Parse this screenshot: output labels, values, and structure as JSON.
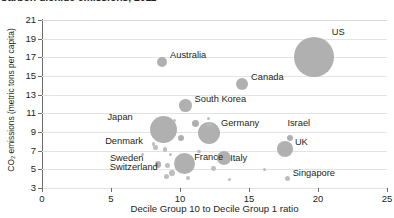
{
  "chart_data": {
    "type": "scatter",
    "title": "Carbon dioxide emissions, 2011",
    "xlabel": "Decile Group 10 to Decile Group 1 ratio",
    "ylabel": "CO₂ emissions (metric tons per capita)",
    "xlim": [
      0,
      25
    ],
    "ylim": [
      3,
      21
    ],
    "xticks": [
      "0",
      "5",
      "10",
      "15",
      "20",
      "25"
    ],
    "yticks": [
      "3",
      "5",
      "7",
      "9",
      "11",
      "13",
      "15",
      "17",
      "19",
      "21"
    ],
    "grid": "horizontal",
    "legend": "none",
    "size_meaning": "bubble area scales with population",
    "points": [
      {
        "name": "US",
        "x": 19.7,
        "y": 17.0,
        "r": 20.0,
        "labeled": true,
        "label_dx": 18,
        "label_dy": -24
      },
      {
        "name": "Australia",
        "x": 8.7,
        "y": 16.5,
        "r": 5.2,
        "labeled": true,
        "label_dx": 8,
        "label_dy": -6
      },
      {
        "name": "Canada",
        "x": 14.5,
        "y": 14.1,
        "r": 6.0,
        "labeled": true,
        "label_dx": 9,
        "label_dy": -6
      },
      {
        "name": "South Korea",
        "x": 10.4,
        "y": 11.8,
        "r": 6.4,
        "labeled": true,
        "label_dx": 9,
        "label_dy": -6
      },
      {
        "name": "Japan",
        "x": 8.8,
        "y": 9.3,
        "r": 13.5,
        "labeled": true,
        "label_dx": -56,
        "label_dy": -11
      },
      {
        "name": "Germany",
        "x": 12.1,
        "y": 8.9,
        "r": 11.0,
        "labeled": true,
        "label_dx": 12,
        "label_dy": -9
      },
      {
        "name": "Israel",
        "x": 18.0,
        "y": 8.4,
        "r": 3.0,
        "labeled": true,
        "label_dx": -3,
        "label_dy": -14
      },
      {
        "name": "UK",
        "x": 17.6,
        "y": 7.2,
        "r": 8.2,
        "labeled": true,
        "label_dx": 10,
        "label_dy": -6
      },
      {
        "name": "Denmark",
        "x": 8.2,
        "y": 7.3,
        "r": 2.6,
        "labeled": true,
        "label_dx": -50,
        "label_dy": -6
      },
      {
        "name": "France",
        "x": 10.3,
        "y": 5.6,
        "r": 10.5,
        "labeled": true,
        "label_dx": 10,
        "label_dy": -6
      },
      {
        "name": "Sweden",
        "x": 8.4,
        "y": 5.5,
        "r": 3.2,
        "labeled": true,
        "label_dx": -48,
        "label_dy": -6
      },
      {
        "name": "Switzerland",
        "x": 9.4,
        "y": 4.6,
        "r": 2.8,
        "labeled": true,
        "label_dx": -62,
        "label_dy": -5
      },
      {
        "name": "Italy",
        "x": 13.2,
        "y": 6.2,
        "r": 7.2,
        "labeled": true,
        "label_dx": 6,
        "label_dy": 1
      },
      {
        "name": "Singapore",
        "x": 17.8,
        "y": 4.0,
        "r": 2.6,
        "labeled": true,
        "label_dx": 5,
        "label_dy": -5
      },
      {
        "name": "unlabeled-1",
        "x": 11.1,
        "y": 9.9,
        "r": 3.4,
        "labeled": false
      },
      {
        "name": "unlabeled-2",
        "x": 12.1,
        "y": 9.8,
        "r": 2.6,
        "labeled": false
      },
      {
        "name": "unlabeled-3",
        "x": 10.1,
        "y": 8.4,
        "r": 3.0,
        "labeled": false
      },
      {
        "name": "unlabeled-4",
        "x": 8.1,
        "y": 7.7,
        "r": 1.7,
        "labeled": false
      },
      {
        "name": "unlabeled-5",
        "x": 8.9,
        "y": 7.1,
        "r": 2.3,
        "labeled": false
      },
      {
        "name": "unlabeled-6",
        "x": 11.4,
        "y": 6.9,
        "r": 1.9,
        "labeled": false
      },
      {
        "name": "unlabeled-7",
        "x": 9.3,
        "y": 6.6,
        "r": 1.5,
        "labeled": false
      },
      {
        "name": "unlabeled-8",
        "x": 7.3,
        "y": 6.6,
        "r": 1.5,
        "labeled": false
      },
      {
        "name": "unlabeled-9",
        "x": 9.1,
        "y": 5.4,
        "r": 2.6,
        "labeled": false
      },
      {
        "name": "unlabeled-10",
        "x": 12.4,
        "y": 5.1,
        "r": 2.4,
        "labeled": false
      },
      {
        "name": "unlabeled-11",
        "x": 9.0,
        "y": 4.2,
        "r": 2.6,
        "labeled": false
      },
      {
        "name": "unlabeled-12",
        "x": 10.6,
        "y": 4.1,
        "r": 1.9,
        "labeled": false
      },
      {
        "name": "unlabeled-13",
        "x": 13.6,
        "y": 3.9,
        "r": 1.7,
        "labeled": false
      },
      {
        "name": "unlabeled-14",
        "x": 16.1,
        "y": 5.0,
        "r": 1.6,
        "labeled": false
      },
      {
        "name": "unlabeled-15",
        "x": 12.1,
        "y": 10.4,
        "r": 1.5,
        "labeled": false
      },
      {
        "name": "unlabeled-16",
        "x": 9.6,
        "y": 10.2,
        "r": 1.5,
        "labeled": false
      }
    ]
  },
  "colors": {
    "bubble": "#a9a9a9",
    "grid": "#e3e3e3",
    "axis": "#6d6d6d",
    "text": "#231f20"
  }
}
